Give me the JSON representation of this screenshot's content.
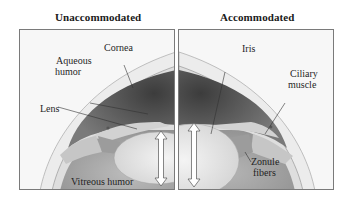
{
  "figure": {
    "panels": [
      {
        "title": "Unaccommodated",
        "labels": {
          "cornea": "Cornea",
          "aqueous_line1": "Aqueous",
          "aqueous_line2": "humor",
          "lens": "Lens",
          "vitreous": "Vitreous humor"
        }
      },
      {
        "title": "Accommodated",
        "labels": {
          "iris": "Iris",
          "ciliary_line1": "Ciliary",
          "ciliary_line2": "muscle",
          "zonule_line1": "Zonule",
          "zonule_line2": "fibers"
        }
      }
    ],
    "icons": [
      "double-arrow-icon",
      "double-arrow-icon"
    ],
    "colors": {
      "background": "#ffffff",
      "panel_border": "#7a7a7a",
      "cornea": "#e9e9e9",
      "aqueous": "#5a5a5a",
      "lens": "#e4e4e4",
      "vitreous": "#a8a8a8",
      "ciliary": "#c8c8c8"
    }
  }
}
